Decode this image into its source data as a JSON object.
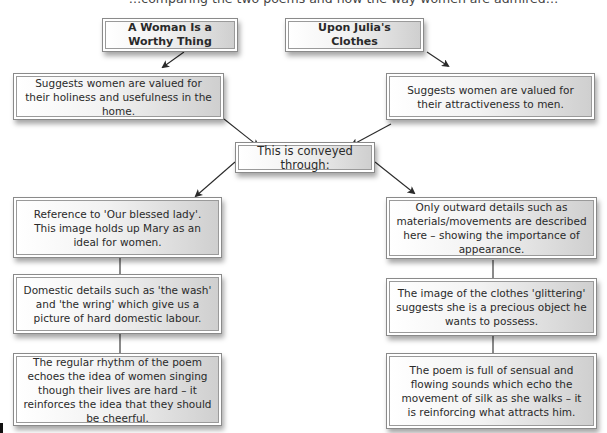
{
  "header": {
    "clipped_text": "…comparing the two poems and how the way women are admired…"
  },
  "diagram": {
    "poems": [
      {
        "title": "A Woman Is a Worthy Thing",
        "summary": "Suggests women are valued for their holiness and usefulness in the home."
      },
      {
        "title": "Upon Julia's Clothes",
        "summary": "Suggests women are valued for their attractiveness to men."
      }
    ],
    "connector": "This is conveyed through:",
    "left_column": [
      "Reference to 'Our blessed lady'. This image holds up Mary as an ideal for women.",
      "Domestic details such as 'the wash' and 'the wring' which give us a picture of hard domestic labour.",
      "The regular rhythm of the poem echoes the idea of women singing though their lives are hard – it reinforces the idea that they should be cheerful."
    ],
    "right_column": [
      "Only outward details such as materials/movements are described here – showing the importance of appearance.",
      "The image of the clothes 'glittering' suggests she is a precious object he wants to possess.",
      "The poem is full of sensual and flowing sounds which echo the movement of silk as she walks – it is reinforcing what attracts him."
    ]
  },
  "colors": {
    "border": "#8a8a8a",
    "arrow": "#2a2a2a",
    "gradient_light": "#ffffff",
    "gradient_dark": "#cfcfcf"
  }
}
